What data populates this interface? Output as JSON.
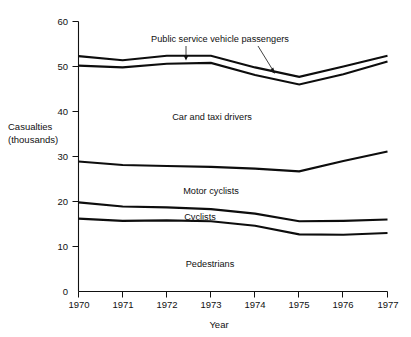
{
  "chart_data": {
    "type": "area",
    "title": "",
    "subtitle": "",
    "xlabel": "Year",
    "ylabel": "Casualties\n(thousands)",
    "ylabel_line1": "Casualties",
    "ylabel_line2": "(thousands)",
    "x": [
      1970,
      1971,
      1972,
      1973,
      1974,
      1975,
      1976,
      1977
    ],
    "categories": [
      "1970",
      "1971",
      "1972",
      "1973",
      "1974",
      "1975",
      "1976",
      "1977"
    ],
    "xlim": [
      1970,
      1977
    ],
    "ylim": [
      0,
      60
    ],
    "yticks": [
      0,
      10,
      20,
      30,
      40,
      50,
      60
    ],
    "ytick_labels": [
      "0",
      "10",
      "20",
      "30",
      "40",
      "50",
      "60"
    ],
    "grid": false,
    "legend_position": "in-plot-annotations",
    "stacked": true,
    "note": "Cumulative boundary lines of a stacked series; each boundary is the running total of bands from bottom (Pedestrians) upward.",
    "series": [
      {
        "name": "Pedestrians",
        "cumulative_values": [
          16.2,
          15.7,
          15.8,
          15.6,
          14.6,
          12.7,
          12.6,
          13.0
        ],
        "band_values": [
          16.2,
          15.7,
          15.8,
          15.6,
          14.6,
          12.7,
          12.6,
          13.0
        ],
        "label": "Pedestrians",
        "label_x": 1972.6,
        "label_y": 6.3
      },
      {
        "name": "Cyclists",
        "cumulative_values": [
          19.8,
          18.9,
          18.7,
          18.3,
          17.3,
          15.6,
          15.7,
          16.0
        ],
        "band_values": [
          3.6,
          3.2,
          2.9,
          2.7,
          2.7,
          2.9,
          3.1,
          3.0
        ],
        "label": "Cyclists",
        "label_x": 1972.5,
        "label_y": 17.3
      },
      {
        "name": "Motor cyclists",
        "cumulative_values": [
          28.9,
          28.1,
          27.9,
          27.7,
          27.3,
          26.7,
          29.0,
          31.1
        ],
        "band_values": [
          9.1,
          9.2,
          9.2,
          9.4,
          10.0,
          11.1,
          13.3,
          15.1
        ],
        "label": "Motor cyclists",
        "label_x": 1972.7,
        "label_y": 22.6
      },
      {
        "name": "Car and taxi drivers",
        "cumulative_values": [
          50.2,
          49.8,
          50.6,
          50.8,
          48.1,
          46.0,
          48.3,
          51.1
        ],
        "band_values": [
          21.3,
          21.7,
          22.7,
          23.1,
          20.8,
          19.3,
          19.3,
          20.0
        ],
        "label": "Car and taxi drivers",
        "label_x": 1972.7,
        "label_y": 38.1
      },
      {
        "name": "Public service vehicle passengers",
        "cumulative_values": [
          52.3,
          51.4,
          52.4,
          52.4,
          49.8,
          47.7,
          50.0,
          52.4
        ],
        "band_values": [
          2.1,
          1.6,
          1.8,
          1.6,
          1.7,
          1.7,
          1.7,
          1.3
        ],
        "label": "Public service vehicle passengers",
        "label_x": 1972.9,
        "label_y": 56.8
      }
    ],
    "annotations": [
      {
        "text": "Public service vehicle passengers",
        "points_to": "thin band between the two topmost lines"
      }
    ]
  },
  "colors": {
    "line": "#0d0d0d",
    "axis": "#111111",
    "background": "#ffffff",
    "text": "#111111"
  }
}
